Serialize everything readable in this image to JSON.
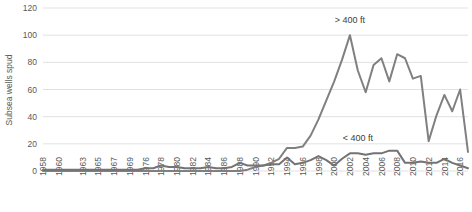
{
  "chart_data": {
    "type": "line",
    "title": "",
    "xlabel": "",
    "ylabel": "Subsea wells spud",
    "ylim": [
      0,
      120
    ],
    "yticks": [
      0,
      20,
      40,
      60,
      80,
      100,
      120
    ],
    "grid": true,
    "legend_position": "inline-annotation",
    "x": [
      1958,
      1959,
      1960,
      1961,
      1962,
      1963,
      1964,
      1965,
      1966,
      1967,
      1968,
      1969,
      1975,
      1976,
      1977,
      1978,
      1979,
      1980,
      1981,
      1982,
      1983,
      1984,
      1985,
      1986,
      1987,
      1988,
      1989,
      1990,
      1991,
      1992,
      1993,
      1994,
      1995,
      1996,
      1997,
      1998,
      1999,
      2000,
      2001,
      2002,
      2003,
      2004,
      2005,
      2006,
      2007,
      2008,
      2009,
      2010,
      2011,
      2012,
      2013,
      2014,
      2015,
      2016,
      2017
    ],
    "xticks": [
      1958,
      1960,
      1963,
      1965,
      1967,
      1969,
      1976,
      1978,
      1980,
      1982,
      1984,
      1986,
      1988,
      1990,
      1992,
      1994,
      1996,
      1998,
      2000,
      2002,
      2004,
      2006,
      2008,
      2010,
      2012,
      2014,
      2016
    ],
    "series": [
      {
        "name": "> 400 ft",
        "label": "> 400 ft",
        "color": "#808080",
        "values": [
          0,
          0,
          0,
          0,
          0,
          0,
          0,
          0,
          0,
          0,
          0,
          0,
          0,
          0,
          0,
          0,
          0,
          0,
          0,
          0,
          0,
          0,
          0,
          0,
          0,
          0,
          1,
          3,
          4,
          6,
          9,
          17,
          17,
          18,
          26,
          38,
          52,
          66,
          82,
          100,
          74,
          58,
          78,
          83,
          66,
          86,
          83,
          68,
          70,
          22,
          41,
          56,
          44,
          60,
          14
        ]
      },
      {
        "name": "< 400 ft",
        "label": "< 400 ft",
        "color": "#737373",
        "values": [
          1,
          1,
          1,
          1,
          1,
          1,
          1,
          1,
          1,
          1,
          1,
          1,
          1,
          2,
          2,
          4,
          3,
          3,
          2,
          2,
          2,
          3,
          2,
          2,
          3,
          6,
          4,
          4,
          4,
          5,
          5,
          10,
          5,
          6,
          8,
          11,
          8,
          4,
          9,
          13,
          13,
          12,
          13,
          13,
          15,
          15,
          6,
          6,
          7,
          6,
          6,
          9,
          6,
          4,
          2
        ]
      }
    ],
    "annotations": [
      {
        "text": "> 400 ft",
        "x": 2002,
        "y": 109,
        "series": "> 400 ft"
      },
      {
        "text": "< 400 ft",
        "x": 2003,
        "y": 22,
        "series": "< 400 ft"
      }
    ]
  }
}
